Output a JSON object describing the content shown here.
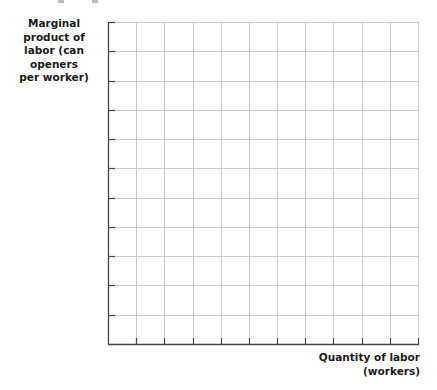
{
  "chart_data": {
    "type": "line",
    "title": "",
    "xlabel": "Quantity of labor (workers)",
    "ylabel": "Marginal product of labor (can openers per worker)",
    "xlabel_lines": [
      "Quantity of labor",
      "(workers)"
    ],
    "ylabel_lines": [
      "Marginal product of",
      "labor (can openers",
      "per worker)"
    ],
    "grid": true,
    "grid_columns": 11,
    "grid_rows": 11,
    "tick_labels_x": [],
    "tick_labels_y": [],
    "series": []
  },
  "colors": {
    "axis": "#444444",
    "grid": "#cccccc",
    "text": "#1a1a1a"
  }
}
